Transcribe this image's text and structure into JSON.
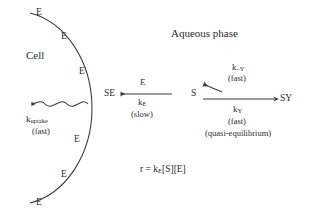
{
  "figure": {
    "regions": {
      "cell_label": "Cell",
      "aqueous_label": "Aqueous phase"
    },
    "membrane_enzymes": [
      {
        "label": "E",
        "x": 36,
        "y": 8
      },
      {
        "label": "E",
        "x": 61,
        "y": 32
      },
      {
        "label": "E",
        "x": 79,
        "y": 67
      },
      {
        "label": "E",
        "x": 74,
        "y": 135
      },
      {
        "label": "E",
        "x": 61,
        "y": 170
      },
      {
        "label": "E",
        "x": 36,
        "y": 198
      }
    ],
    "species": {
      "se": "SE",
      "s": "S",
      "sy": "SY"
    },
    "uptake": {
      "rate_constant": "k",
      "rate_subscript": "uptake",
      "speed": "(fast)"
    },
    "catalysis": {
      "reactant_above": "E",
      "rate_constant": "k",
      "rate_subscript": "E",
      "speed": "(slow)"
    },
    "binding_reverse": {
      "rate_constant": "k",
      "rate_subscript": "–Y",
      "speed": "(fast)"
    },
    "binding_forward": {
      "rate_constant": "k",
      "rate_subscript": "Y",
      "speed": "(fast)",
      "note": "(quasi-equilibrium)"
    },
    "rate_equation": {
      "lhs": "r = k",
      "subscript": "E",
      "rhs": "[S][E]"
    },
    "colors": {
      "ink": "#2b2b2b",
      "stroke": "#3a3a3a",
      "background": "#ffffff"
    }
  }
}
